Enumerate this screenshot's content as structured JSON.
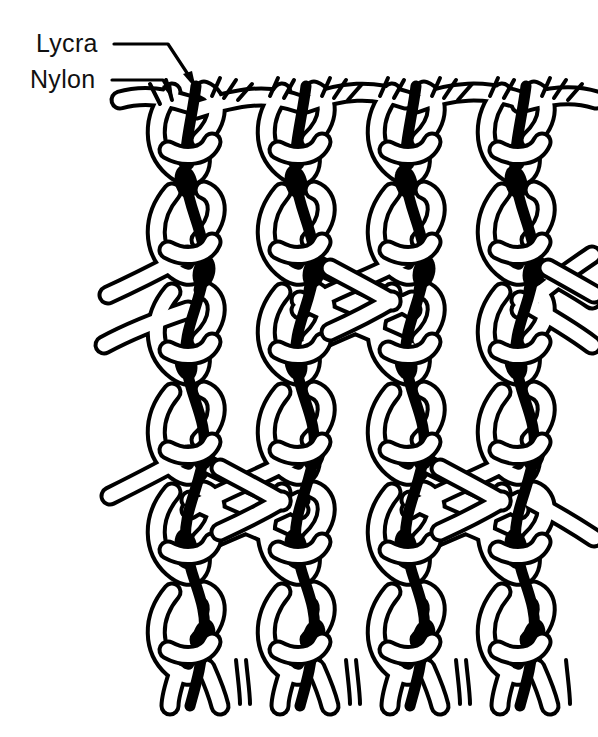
{
  "figure": {
    "background_color": "#ffffff",
    "ink_color": "#000000",
    "width": 598,
    "height": 737
  },
  "annotations": [
    {
      "id": "lycra",
      "label": "Lycra",
      "text_x": 36,
      "text_y": 52,
      "leader": "M 114 44 L 168 44 L 196 86",
      "arrow_x": 196,
      "arrow_y": 86,
      "arrow_angle": 56,
      "target_yarn": "lycra"
    },
    {
      "id": "nylon",
      "label": "Nylon",
      "text_x": 30,
      "text_y": 88,
      "leader": "M 112 80 L 162 80 L 172 96",
      "arrow_x": 172,
      "arrow_y": 96,
      "arrow_angle": 58,
      "target_yarn": "nylon"
    }
  ],
  "legend_keys": [
    {
      "yarn": "nylon",
      "render": "outlined-white-ribbon",
      "color": "#ffffff",
      "outline": "#000000"
    },
    {
      "yarn": "lycra",
      "render": "solid-black-strand",
      "color": "#000000",
      "outline": "#000000"
    }
  ],
  "structure": {
    "type": "warp-knit-locknit",
    "wale_count": 4,
    "wale_x": [
      190,
      300,
      410,
      520
    ],
    "wale_spacing": 110,
    "course_count": 6,
    "course_y": [
      110,
      210,
      310,
      410,
      510,
      610
    ],
    "course_spacing": 100,
    "fabric_top_y": 88,
    "fabric_bottom_y": 697,
    "crossings": [
      {
        "row": 2,
        "between_wales": [
          2,
          3
        ],
        "center_x": 355,
        "center_y": 300
      },
      {
        "row": 2,
        "between_wales": [
          4,
          5
        ],
        "center_x": 575,
        "center_y": 300
      },
      {
        "row": 4,
        "between_wales": [
          1,
          2
        ],
        "center_x": 245,
        "center_y": 500
      },
      {
        "row": 4,
        "between_wales": [
          3,
          4
        ],
        "center_x": 465,
        "center_y": 500
      }
    ]
  },
  "stroke_widths": {
    "yarn_outline": 4.0,
    "yarn_ribbon": 13,
    "lycra": 9,
    "leader_line": 3.2,
    "fringe": 3.0
  }
}
